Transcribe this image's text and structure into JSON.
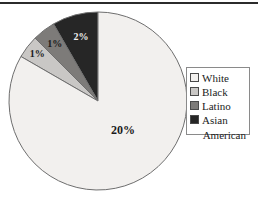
{
  "chart_data": {
    "type": "pie",
    "title": "",
    "subtitle": "",
    "xlabel": "",
    "ylabel": "",
    "grid": false,
    "legend_position": "right",
    "categories": [
      "White",
      "Black",
      "Latino",
      "Asian American"
    ],
    "values": [
      20,
      1,
      1,
      2
    ],
    "value_labels": [
      "20%",
      "1%",
      "1%",
      "2%"
    ],
    "slice_colors": [
      "#f2f0ee",
      "#c9c7c5",
      "#7d7b79",
      "#262626"
    ],
    "slices": [
      {
        "label": "White",
        "value": 20,
        "value_label": "20%",
        "color": "#f2f0ee"
      },
      {
        "label": "Black",
        "value": 1,
        "value_label": "1%",
        "color": "#c9c7c5"
      },
      {
        "label": "Latino",
        "value": 1,
        "value_label": "1%",
        "color": "#7d7b79"
      },
      {
        "label": "Asian American",
        "value": 2,
        "value_label": "2%",
        "color": "#262626"
      }
    ],
    "annotations": []
  },
  "legend": {
    "entries": [
      {
        "label": "White",
        "color": "#f2f0ee"
      },
      {
        "label": "Black",
        "color": "#c9c7c5"
      },
      {
        "label": "Latino",
        "color": "#7d7b79"
      },
      {
        "label": "Asian",
        "color": "#262626"
      }
    ],
    "wrapped_continuation": "American",
    "border_color": "#8a8a8a"
  },
  "figure": {
    "background": "#ffffff",
    "rule_color": "#2b2b2b",
    "outline_color": "#6e6e6e"
  }
}
